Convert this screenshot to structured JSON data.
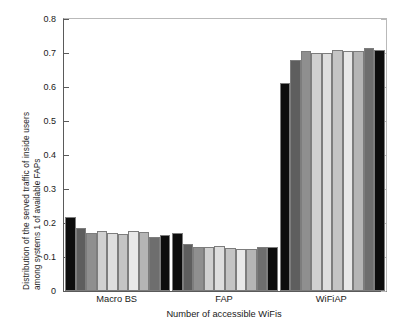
{
  "chart_data": {
    "type": "bar",
    "title": "",
    "subtitle": "",
    "xlabel": "Number of accessible WiFis",
    "ylabel_line1": "Distribution of the served traffic of inside users",
    "ylabel_line2": "among systems 1 of available  FAPs",
    "categories": [
      "Macro BS",
      "FAP",
      "WiFiAP"
    ],
    "ylim": [
      0,
      0.8
    ],
    "ytick_labels": [
      "0",
      "0.1",
      "0.2",
      "0.3",
      "0.4",
      "0.5",
      "0.6",
      "0.7",
      "0.8"
    ],
    "ytick_values": [
      0,
      0.1,
      0.2,
      0.3,
      0.4,
      0.5,
      0.6,
      0.7,
      0.8
    ],
    "grid": false,
    "legend": false,
    "legend_position": "none",
    "bars_per_group": 10,
    "series": [
      {
        "name": "1",
        "color": "#0d0d0d",
        "values": [
          0.218,
          0.171,
          0.612
        ]
      },
      {
        "name": "2",
        "color": "#5e5e5e",
        "values": [
          0.185,
          0.139,
          0.68
        ]
      },
      {
        "name": "3",
        "color": "#8f8f8f",
        "values": [
          0.171,
          0.129,
          0.705
        ]
      },
      {
        "name": "4",
        "color": "#d0d0d0",
        "values": [
          0.176,
          0.129,
          0.7
        ]
      },
      {
        "name": "5",
        "color": "#dedede",
        "values": [
          0.171,
          0.132,
          0.7
        ]
      },
      {
        "name": "6",
        "color": "#c4c4c4",
        "values": [
          0.167,
          0.127,
          0.71
        ]
      },
      {
        "name": "7",
        "color": "#e8e8e8",
        "values": [
          0.177,
          0.123,
          0.705
        ]
      },
      {
        "name": "8",
        "color": "#b5b5b5",
        "values": [
          0.174,
          0.124,
          0.707
        ]
      },
      {
        "name": "9",
        "color": "#6e6e6e",
        "values": [
          0.16,
          0.129,
          0.716
        ]
      },
      {
        "name": "10",
        "color": "#0d0d0d",
        "values": [
          0.166,
          0.129,
          0.709
        ]
      }
    ]
  },
  "axes": {
    "y_axis_name": "distribution-axis",
    "x_axis_name": "category-axis"
  }
}
